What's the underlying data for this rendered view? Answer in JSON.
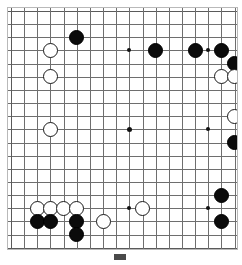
{
  "figure": {
    "kind": "go-board-diagram",
    "caption_text": "",
    "caption_marker": "figure-marker"
  },
  "board": {
    "size": 19,
    "columns": 19,
    "rows": 19,
    "line_color": "#6e6e6e",
    "edge_color": "#5a5a5a",
    "background_color": "#ffffff",
    "black_color": "#0b0b0b",
    "white_color": "#ffffff",
    "white_outline_color": "#1a1a1a",
    "star_points": [
      {
        "col": 4,
        "row": 4
      },
      {
        "col": 10,
        "row": 4
      },
      {
        "col": 16,
        "row": 4
      },
      {
        "col": 4,
        "row": 10
      },
      {
        "col": 10,
        "row": 10
      },
      {
        "col": 16,
        "row": 10
      },
      {
        "col": 4,
        "row": 16
      },
      {
        "col": 10,
        "row": 16
      },
      {
        "col": 16,
        "row": 16
      }
    ],
    "stones": [
      {
        "color": "black",
        "col": 6,
        "row": 3
      },
      {
        "color": "white",
        "col": 4,
        "row": 4
      },
      {
        "color": "black",
        "col": 12,
        "row": 4
      },
      {
        "color": "black",
        "col": 15,
        "row": 4
      },
      {
        "color": "black",
        "col": 17,
        "row": 4
      },
      {
        "color": "black",
        "col": 18,
        "row": 5
      },
      {
        "color": "white",
        "col": 4,
        "row": 6
      },
      {
        "color": "white",
        "col": 17,
        "row": 6
      },
      {
        "color": "white",
        "col": 18,
        "row": 6
      },
      {
        "color": "white",
        "col": 18,
        "row": 9
      },
      {
        "color": "white",
        "col": 4,
        "row": 10
      },
      {
        "color": "black",
        "col": 18,
        "row": 11
      },
      {
        "color": "black",
        "col": 17,
        "row": 15
      },
      {
        "color": "white",
        "col": 3,
        "row": 16
      },
      {
        "color": "white",
        "col": 4,
        "row": 16
      },
      {
        "color": "white",
        "col": 5,
        "row": 16
      },
      {
        "color": "white",
        "col": 6,
        "row": 16
      },
      {
        "color": "white",
        "col": 11,
        "row": 16
      },
      {
        "color": "black",
        "col": 3,
        "row": 17
      },
      {
        "color": "black",
        "col": 4,
        "row": 17
      },
      {
        "color": "black",
        "col": 6,
        "row": 17
      },
      {
        "color": "white",
        "col": 8,
        "row": 17
      },
      {
        "color": "black",
        "col": 17,
        "row": 17
      },
      {
        "color": "black",
        "col": 6,
        "row": 18
      }
    ]
  }
}
